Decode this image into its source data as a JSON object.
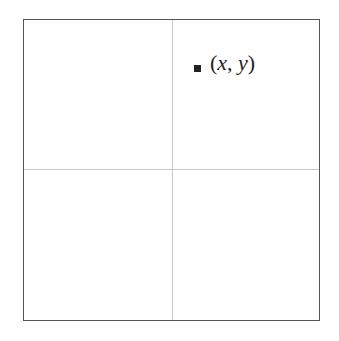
{
  "diagram": {
    "frame": {
      "border_color": "#555555"
    },
    "axes": {
      "line_color": "#c8c8c8"
    },
    "point": {
      "marker_color": "#222222",
      "label_open": "(",
      "label_x": "x",
      "label_sep": ", ",
      "label_y": "y",
      "label_close": ")"
    }
  }
}
